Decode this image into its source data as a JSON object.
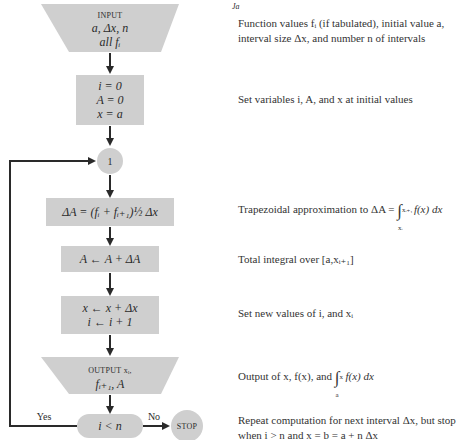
{
  "flowchart": {
    "colors": {
      "box_fill": "#cfcfcf",
      "line": "#2a2a2a",
      "text": "#2b2b2b"
    },
    "nodes": [
      {
        "id": "input",
        "shape": "trapezoid",
        "label": "INPUT",
        "lines": [
          "a, Δx, n",
          "all fᵢ"
        ]
      },
      {
        "id": "init",
        "shape": "rectangle",
        "lines": [
          "i = 0",
          "A = 0",
          "x = a"
        ]
      },
      {
        "id": "connector",
        "shape": "circle",
        "label": "1"
      },
      {
        "id": "trap",
        "shape": "rectangle",
        "lines": [
          "ΔA = (fᵢ + fᵢ₊₁)½ Δx"
        ]
      },
      {
        "id": "accum",
        "shape": "rectangle",
        "lines": [
          "A ← A + ΔA"
        ]
      },
      {
        "id": "incr",
        "shape": "rectangle",
        "lines": [
          "x ← x + Δx",
          "i ← i + 1"
        ]
      },
      {
        "id": "output",
        "shape": "trapezoid",
        "label": "OUTPUT xᵢ,",
        "lines": [
          "fᵢ₊₁, A"
        ]
      },
      {
        "id": "decision",
        "shape": "rounded",
        "lines": [
          "i < n"
        ]
      },
      {
        "id": "stop",
        "shape": "circle",
        "label": "STOP"
      }
    ],
    "edge_labels": {
      "yes": "Yes",
      "no": "No"
    }
  },
  "descriptions": {
    "input": {
      "line1": "Function values fᵢ (if tabulated), initial value a,",
      "line2": "interval size Δx, and number n of intervals"
    },
    "init": "Set variables i, A, and x at initial values",
    "trap_prefix": "Trapezoidal approximation to ΔA = ",
    "trap_integrand": "f(x) dx",
    "trap_upper": "xᵢ₊₁",
    "trap_lower": "xᵢ",
    "accum": "Total integral over [a,xᵢ₊₁]",
    "incr": "Set new values of i, and xᵢ",
    "output_prefix": "Output of x, f(x), and ",
    "output_integrand": "f(x) dx",
    "output_upper": "x",
    "output_lower": "a",
    "decision": {
      "line1": "Repeat computation for next interval Δx, but stop",
      "line2": "when i > n and x = b = a + n Δx"
    }
  }
}
